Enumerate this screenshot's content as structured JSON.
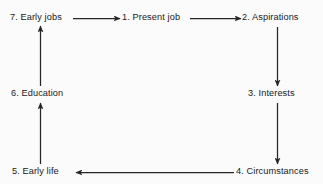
{
  "diagram": {
    "background_color": "#fbfbfb",
    "line_color": "#262626",
    "text_color": "#1a1a1a",
    "nodes": [
      {
        "id": "node-1",
        "label": "1. Present job",
        "icon": "text-node"
      },
      {
        "id": "node-2",
        "label": "2. Aspirations",
        "icon": "text-node"
      },
      {
        "id": "node-3",
        "label": "3. Interests",
        "icon": "text-node"
      },
      {
        "id": "node-4",
        "label": "4. Circumstances",
        "icon": "text-node"
      },
      {
        "id": "node-5",
        "label": "5. Early life",
        "icon": "text-node"
      },
      {
        "id": "node-6",
        "label": "6. Education",
        "icon": "text-node"
      },
      {
        "id": "node-7",
        "label": "7. Early jobs",
        "icon": "text-node"
      }
    ],
    "edges": [
      {
        "from": "7. Early jobs",
        "to": "1. Present job",
        "direction": "right",
        "icon": "arrow-right-icon"
      },
      {
        "from": "1. Present job",
        "to": "2. Aspirations",
        "direction": "right",
        "icon": "arrow-right-icon"
      },
      {
        "from": "2. Aspirations",
        "to": "3. Interests",
        "direction": "down",
        "icon": "arrow-down-icon"
      },
      {
        "from": "3. Interests",
        "to": "4. Circumstances",
        "direction": "down",
        "icon": "arrow-down-icon"
      },
      {
        "from": "4. Circumstances",
        "to": "5. Early life",
        "direction": "left",
        "icon": "arrow-left-icon"
      },
      {
        "from": "5. Early life",
        "to": "6. Education",
        "direction": "up",
        "icon": "arrow-up-icon"
      },
      {
        "from": "6. Education",
        "to": "7. Early jobs",
        "direction": "up",
        "icon": "arrow-up-icon"
      }
    ]
  }
}
